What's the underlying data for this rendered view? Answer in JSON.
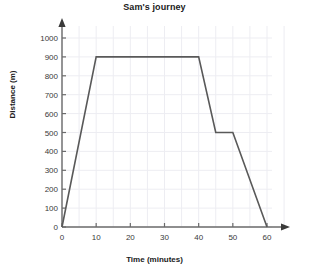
{
  "chart_data": {
    "type": "line",
    "title": "Sam's journey",
    "xlabel": "Time (minutes)",
    "ylabel": "Distance (m)",
    "x": [
      0,
      10,
      40,
      45,
      50,
      60
    ],
    "values": [
      0,
      900,
      900,
      500,
      500,
      0
    ],
    "series": [
      {
        "name": "Sam's journey",
        "points": [
          {
            "x": 0,
            "y": 0
          },
          {
            "x": 10,
            "y": 900
          },
          {
            "x": 40,
            "y": 900
          },
          {
            "x": 45,
            "y": 500
          },
          {
            "x": 50,
            "y": 500
          },
          {
            "x": 60,
            "y": 0
          }
        ]
      }
    ],
    "xlim": [
      0,
      60
    ],
    "ylim": [
      0,
      1000
    ],
    "xticks": [
      0,
      10,
      20,
      30,
      40,
      50,
      60
    ],
    "yticks": [
      0,
      100,
      200,
      300,
      400,
      500,
      600,
      700,
      800,
      900,
      1000
    ],
    "xtick_labels": [
      "0",
      "10",
      "20",
      "30",
      "40",
      "50",
      "60"
    ],
    "ytick_labels": [
      "0",
      "100",
      "200",
      "300",
      "400",
      "500",
      "600",
      "700",
      "800",
      "900",
      "1000"
    ],
    "x_minor_step": 5,
    "y_minor_step": 100,
    "grid": true,
    "legend": null,
    "legend_position": "none",
    "line_color": "#595959",
    "grid_color": "#ededf2",
    "axis_color": "#6b6b6b",
    "text_color": "#202020",
    "axis_arrows": true
  }
}
